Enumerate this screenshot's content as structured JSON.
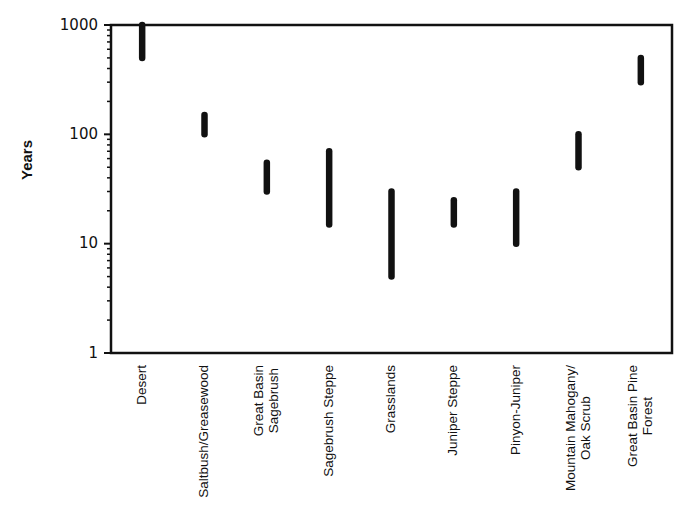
{
  "chart_data": {
    "type": "range-bar",
    "title": "",
    "xlabel": "",
    "ylabel": "Years",
    "yscale": "log",
    "ylim": [
      1,
      1000
    ],
    "yticks": [
      1,
      10,
      100,
      1000
    ],
    "ytick_labels": [
      "1",
      "10",
      "100",
      "1000"
    ],
    "grid": false,
    "legend": null,
    "categories": [
      "Desert",
      "Saltbush/Greasewood",
      "Great Basin Sagebrush",
      "Sagebrush Steppe",
      "Grasslands",
      "Juniper Steppe",
      "Pinyon-Juniper",
      "Mountain Mahogany/Oak Scrub",
      "Great Basin Pine Forest"
    ],
    "category_label_lines": [
      [
        "Desert"
      ],
      [
        "Saltbush/Greasewood"
      ],
      [
        "Great Basin",
        "Sagebrush"
      ],
      [
        "Sagebrush Steppe"
      ],
      [
        "Grasslands"
      ],
      [
        "Juniper Steppe"
      ],
      [
        "Pinyon-Juniper"
      ],
      [
        "Mountain Mahogany/",
        "Oak Scrub"
      ],
      [
        "Great Basin Pine",
        "Forest"
      ]
    ],
    "series": [
      {
        "name": "min",
        "values": [
          500,
          100,
          30,
          15,
          5,
          15,
          10,
          50,
          300
        ]
      },
      {
        "name": "max",
        "values": [
          1000,
          150,
          55,
          70,
          30,
          25,
          30,
          100,
          500
        ]
      }
    ]
  },
  "style": {
    "ink_color": "#111111",
    "background": "#ffffff"
  }
}
